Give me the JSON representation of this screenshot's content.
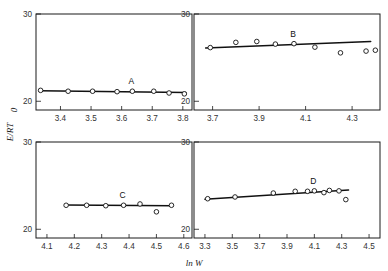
{
  "figure": {
    "ylabel": "E/RT",
    "ylabel_sub": "0",
    "xlabel": "ln W",
    "panel_labels": [
      "A",
      "B",
      "C",
      "D"
    ]
  },
  "chart_data": [
    {
      "type": "scatter",
      "title": "A",
      "xlabel": "ln W",
      "ylabel": "E/RT_0",
      "xlim": [
        3.32,
        3.83
      ],
      "ylim": [
        19.0,
        30.0
      ],
      "xticks": [
        3.4,
        3.5,
        3.6,
        3.7,
        3.8
      ],
      "xtick_labels": [
        "3.4",
        "3.5",
        "3.6",
        "3.7",
        "3.8"
      ],
      "yticks": [
        20,
        30
      ],
      "ytick_labels": [
        "20",
        "30"
      ],
      "grid": false,
      "points": [
        {
          "x": 3.335,
          "y": 21.25
        },
        {
          "x": 3.425,
          "y": 21.15
        },
        {
          "x": 3.505,
          "y": 21.15
        },
        {
          "x": 3.585,
          "y": 21.1
        },
        {
          "x": 3.635,
          "y": 21.15
        },
        {
          "x": 3.705,
          "y": 21.15
        },
        {
          "x": 3.755,
          "y": 20.95
        },
        {
          "x": 3.805,
          "y": 20.85
        }
      ],
      "fit_line": [
        {
          "x": 3.33,
          "y": 21.2
        },
        {
          "x": 3.81,
          "y": 21.0
        }
      ]
    },
    {
      "type": "scatter",
      "title": "B",
      "xlabel": "ln W",
      "ylabel": "E/RT_0",
      "xlim": [
        3.62,
        4.42
      ],
      "ylim": [
        19.0,
        30.0
      ],
      "xticks": [
        3.7,
        3.9,
        4.1,
        4.3
      ],
      "xtick_labels": [
        "3.7",
        "3.9",
        "4.1",
        "4.3"
      ],
      "yticks": [
        20,
        30
      ],
      "ytick_labels": [
        "20",
        "30"
      ],
      "grid": false,
      "points": [
        {
          "x": 3.69,
          "y": 26.15
        },
        {
          "x": 3.8,
          "y": 26.75
        },
        {
          "x": 3.89,
          "y": 26.85
        },
        {
          "x": 3.97,
          "y": 26.55
        },
        {
          "x": 4.05,
          "y": 26.6
        },
        {
          "x": 4.14,
          "y": 26.2
        },
        {
          "x": 4.25,
          "y": 25.55
        },
        {
          "x": 4.36,
          "y": 25.75
        },
        {
          "x": 4.4,
          "y": 25.85
        }
      ],
      "fit_line": [
        {
          "x": 3.67,
          "y": 26.1
        },
        {
          "x": 4.38,
          "y": 26.85
        }
      ]
    },
    {
      "type": "scatter",
      "title": "C",
      "xlabel": "ln W",
      "ylabel": "E/RT_0",
      "xlim": [
        4.06,
        4.63
      ],
      "ylim": [
        19.0,
        30.0
      ],
      "xticks": [
        4.1,
        4.2,
        4.3,
        4.4,
        4.5,
        4.6
      ],
      "xtick_labels": [
        "4.1",
        "4.2",
        "4.3",
        "4.4",
        "4.5",
        "4.6"
      ],
      "yticks": [
        20,
        30
      ],
      "ytick_labels": [
        "20",
        "30"
      ],
      "grid": false,
      "points": [
        {
          "x": 4.17,
          "y": 22.75
        },
        {
          "x": 4.245,
          "y": 22.75
        },
        {
          "x": 4.315,
          "y": 22.7
        },
        {
          "x": 4.38,
          "y": 22.75
        },
        {
          "x": 4.44,
          "y": 22.9
        },
        {
          "x": 4.5,
          "y": 22.0
        },
        {
          "x": 4.555,
          "y": 22.75
        }
      ],
      "fit_line": [
        {
          "x": 4.165,
          "y": 22.78
        },
        {
          "x": 4.56,
          "y": 22.7
        }
      ]
    },
    {
      "type": "scatter",
      "title": "D",
      "xlabel": "ln W",
      "ylabel": "E/RT_0",
      "xlim": [
        3.22,
        4.58
      ],
      "ylim": [
        19.0,
        30.0
      ],
      "xticks": [
        3.3,
        3.5,
        3.7,
        3.9,
        4.1,
        4.3,
        4.5
      ],
      "xtick_labels": [
        "3.3",
        "3.5",
        "3.7",
        "3.9",
        "4.1",
        "4.3",
        "4.5"
      ],
      "yticks": [
        20,
        30
      ],
      "ytick_labels": [
        "20",
        "30"
      ],
      "grid": false,
      "points": [
        {
          "x": 3.32,
          "y": 23.5
        },
        {
          "x": 3.52,
          "y": 23.7
        },
        {
          "x": 3.8,
          "y": 24.15
        },
        {
          "x": 3.96,
          "y": 24.35
        },
        {
          "x": 4.05,
          "y": 24.35
        },
        {
          "x": 4.1,
          "y": 24.4
        },
        {
          "x": 4.17,
          "y": 24.2
        },
        {
          "x": 4.21,
          "y": 24.45
        },
        {
          "x": 4.28,
          "y": 24.4
        },
        {
          "x": 4.33,
          "y": 23.4
        }
      ],
      "fit_line": [
        {
          "x": 3.3,
          "y": 23.45
        },
        {
          "x": 4.35,
          "y": 24.5
        }
      ]
    }
  ]
}
